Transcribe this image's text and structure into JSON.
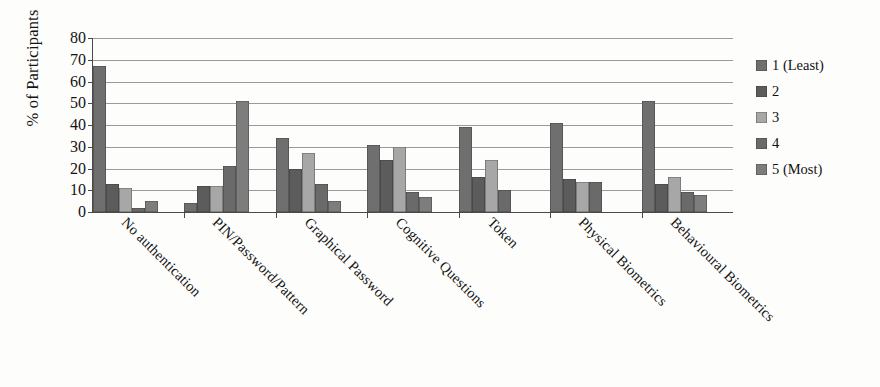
{
  "chart_data": {
    "type": "bar",
    "title": "",
    "subtitle": "",
    "xlabel": "",
    "ylabel": "% of Participants",
    "ylim": [
      0,
      80
    ],
    "ytick_step": 10,
    "yticks": [
      80,
      70,
      60,
      50,
      40,
      30,
      20,
      10,
      0
    ],
    "grid": true,
    "grid_axis": "y",
    "legend_position": "right",
    "orientation": "vertical",
    "grouping": "clustered",
    "categories": [
      "No authentication",
      "PIN/Password/Pattern",
      "Graphical Password",
      "Cognitive Questions",
      "Token",
      "Physical Biometrics",
      "Behavioural Biometrics"
    ],
    "series": [
      {
        "name": "1 (Least)",
        "color": "#6f6f6f",
        "values": [
          67,
          4,
          34,
          31,
          39,
          41,
          51
        ]
      },
      {
        "name": "2",
        "color": "#5c5c5c",
        "values": [
          13,
          12,
          20,
          24,
          16,
          15,
          13
        ]
      },
      {
        "name": "3",
        "color": "#a7a7a7",
        "values": [
          11,
          12,
          27,
          30,
          24,
          14,
          16
        ]
      },
      {
        "name": "4",
        "color": "#6a6a6a",
        "values": [
          2,
          21,
          13,
          9,
          10,
          14,
          9
        ]
      },
      {
        "name": "5 (Most)",
        "color": "#7d7d7d",
        "values": [
          5,
          51,
          5,
          7,
          0,
          0,
          8
        ]
      }
    ],
    "annotations": []
  },
  "legend": {
    "items": [
      {
        "label": "1 (Least)"
      },
      {
        "label": "2"
      },
      {
        "label": "3"
      },
      {
        "label": "4"
      },
      {
        "label": "5 (Most)"
      }
    ]
  },
  "axes": {
    "y_title": "% of Participants"
  }
}
